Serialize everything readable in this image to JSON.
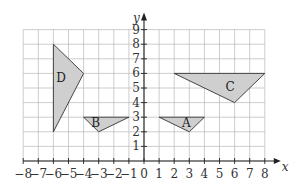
{
  "diagram": {
    "type": "coordinate-grid",
    "x_axis": {
      "label": "x",
      "min": -8,
      "max": 8,
      "ticks": [
        "-8",
        "-7",
        "-6",
        "-5",
        "-4",
        "-3",
        "-2",
        "-1",
        "0",
        "1",
        "2",
        "3",
        "4",
        "5",
        "6",
        "7",
        "8"
      ]
    },
    "y_axis": {
      "label": "y",
      "min": 0,
      "max": 9,
      "ticks": [
        "1",
        "2",
        "3",
        "4",
        "5",
        "6",
        "7",
        "8",
        "9"
      ]
    },
    "origin_label": "0",
    "shape_fill": "#cfcfcf",
    "shapes": [
      {
        "label": "A",
        "vertices": [
          [
            1,
            3
          ],
          [
            4,
            3
          ],
          [
            3,
            2
          ]
        ],
        "label_pos": [
          2.8,
          2.6
        ]
      },
      {
        "label": "B",
        "vertices": [
          [
            -4,
            3
          ],
          [
            -1,
            3
          ],
          [
            -3,
            2
          ]
        ],
        "label_pos": [
          -3.2,
          2.6
        ]
      },
      {
        "label": "C",
        "vertices": [
          [
            2,
            6
          ],
          [
            8,
            6
          ],
          [
            6,
            4
          ]
        ],
        "label_pos": [
          5.7,
          5.1
        ]
      },
      {
        "label": "D",
        "vertices": [
          [
            -6,
            8
          ],
          [
            -4,
            6
          ],
          [
            -6,
            2
          ]
        ],
        "label_pos": [
          -5.5,
          5.7
        ]
      }
    ]
  }
}
